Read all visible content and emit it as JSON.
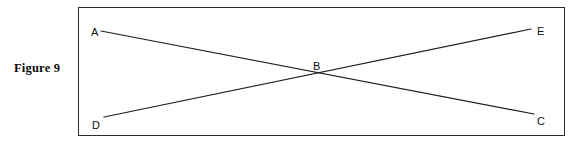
{
  "figure": {
    "caption": "Figure 9",
    "border_color": "#2a2a2a",
    "line_color": "#1d1d1d",
    "background": "#ffffff"
  },
  "diagram": {
    "type": "geometry-line-diagram",
    "points": [
      {
        "id": "A",
        "label": "A",
        "label_x": 12,
        "label_y": 28,
        "x": 22,
        "y": 23
      },
      {
        "id": "B",
        "label": "B",
        "label_x": 240,
        "label_y": 61,
        "x": 239,
        "y": 66
      },
      {
        "id": "C",
        "label": "C",
        "label_x": 457,
        "label_y": 116,
        "x": 455,
        "y": 106
      },
      {
        "id": "D",
        "label": "D",
        "label_x": 14,
        "label_y": 120,
        "x": 25,
        "y": 109
      },
      {
        "id": "E",
        "label": "E",
        "label_x": 457,
        "label_y": 27,
        "x": 452,
        "y": 21
      }
    ],
    "segments": [
      {
        "id": "AC",
        "from": "A",
        "to": "C",
        "x1": 22,
        "y1": 23,
        "x2": 455,
        "y2": 106
      },
      {
        "id": "DE",
        "from": "D",
        "to": "E",
        "x1": 25,
        "y1": 109,
        "x2": 452,
        "y2": 21
      }
    ]
  }
}
